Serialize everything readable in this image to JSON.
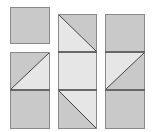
{
  "colors": {
    "dark": "#c9c9c9",
    "light": "#e6e6e6",
    "stroke": "#444444",
    "border": "#8a8a8a"
  },
  "columns": [
    {
      "name": "column-1",
      "tiles": [
        {
          "x": 10,
          "y": 7,
          "w": 40,
          "h": 37,
          "type": "solid",
          "fill": "dark"
        },
        {
          "x": 10,
          "y": 52,
          "w": 40,
          "h": 38,
          "type": "diag-bl-tr",
          "upper": "dark",
          "lower": "light"
        },
        {
          "x": 10,
          "y": 90,
          "w": 40,
          "h": 39,
          "type": "solid",
          "fill": "dark"
        }
      ]
    },
    {
      "name": "column-2",
      "tiles": [
        {
          "x": 58,
          "y": 14,
          "w": 39,
          "h": 38,
          "type": "diag-tl-br",
          "upper": "dark",
          "lower": "light"
        },
        {
          "x": 58,
          "y": 52,
          "w": 39,
          "h": 38,
          "type": "solid",
          "fill": "light"
        },
        {
          "x": 58,
          "y": 90,
          "w": 39,
          "h": 39,
          "type": "diag-tl-br",
          "upper": "light",
          "lower": "dark"
        }
      ]
    },
    {
      "name": "column-3",
      "tiles": [
        {
          "x": 105,
          "y": 14,
          "w": 40,
          "h": 38,
          "type": "solid",
          "fill": "dark"
        },
        {
          "x": 105,
          "y": 52,
          "w": 40,
          "h": 38,
          "type": "diag-bl-tr",
          "upper": "light",
          "lower": "dark"
        },
        {
          "x": 105,
          "y": 90,
          "w": 40,
          "h": 39,
          "type": "solid",
          "fill": "dark"
        }
      ]
    }
  ]
}
